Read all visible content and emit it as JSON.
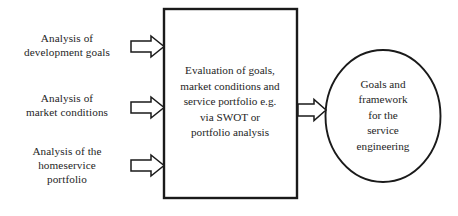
{
  "diagram": {
    "colors": {
      "stroke": "#1a1a1a",
      "background": "#ffffff",
      "text": "#1e1e1e"
    },
    "inputs": [
      {
        "name": "analysis-of-development-goals",
        "lines": [
          "Analysis of",
          "development goals"
        ]
      },
      {
        "name": "analysis-of-market-conditions",
        "lines": [
          "Analysis of",
          "market conditions"
        ]
      },
      {
        "name": "analysis-of-homeservice-portfolio",
        "lines": [
          "Analysis of the",
          "homeservice",
          "portfolio"
        ]
      }
    ],
    "process": {
      "name": "evaluation-process",
      "lines": [
        "Evaluation of goals,",
        "market conditions and",
        "service portfolio e.g.",
        "via SWOT or",
        "portfolio analysis"
      ]
    },
    "outcome": {
      "name": "goals-and-framework",
      "lines": [
        "Goals and",
        "framework",
        "for the",
        "service",
        "engineering"
      ]
    },
    "arrows": [
      {
        "name": "input-arrow-development-goals",
        "direction": "right"
      },
      {
        "name": "input-arrow-market-conditions",
        "direction": "right"
      },
      {
        "name": "input-arrow-homeservice-portfolio",
        "direction": "right"
      },
      {
        "name": "output-arrow-to-outcome",
        "direction": "right"
      }
    ]
  }
}
